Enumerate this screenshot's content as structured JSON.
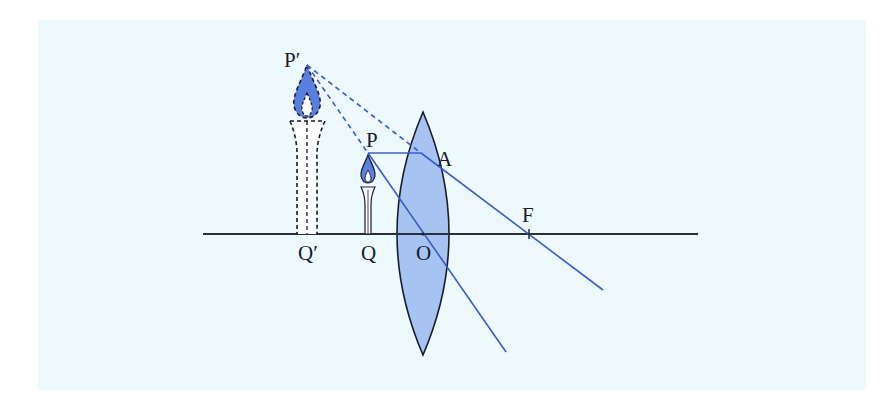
{
  "diagram": {
    "colors": {
      "background": "#eef9fd",
      "lens_fill": "#9fbcf0",
      "lens_stroke": "#1a1a2a",
      "ray": "#3a5ccc",
      "flame_fill": "#5b7fe0",
      "axis": "#2a2f3a"
    },
    "labels": {
      "image_top": "P′",
      "object_top": "P",
      "refraction_point": "A",
      "focal_point": "F",
      "image_base": "Q′",
      "object_base": "Q",
      "optical_center": "O"
    },
    "elements": {
      "principal_axis": "principal axis",
      "lens": "convex lens",
      "object": "candle (object)",
      "image": "virtual image (dashed)",
      "rays": [
        "ray from P parallel to axis, refracts at A through F",
        "ray from P through optical centre O (undeviated)",
        "dashed back-extensions of refracted rays meeting at P′"
      ]
    }
  }
}
